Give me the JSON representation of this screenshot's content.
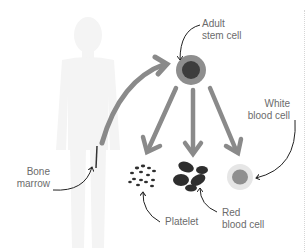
{
  "diagram": {
    "labels": {
      "stem_cell": [
        "Adult",
        "stem cell"
      ],
      "white_blood_cell": [
        "White",
        "blood cell"
      ],
      "bone_marrow": [
        "Bone",
        "marrow"
      ],
      "platelet": "Platelet",
      "red_blood_cell": [
        "Red",
        "blood cell"
      ]
    },
    "nodes": [
      {
        "id": "body",
        "type": "human-silhouette"
      },
      {
        "id": "bone-marrow",
        "type": "location-marker"
      },
      {
        "id": "stem-cell",
        "type": "cell"
      },
      {
        "id": "platelets",
        "type": "cell-cluster"
      },
      {
        "id": "red-blood-cells",
        "type": "cell-cluster"
      },
      {
        "id": "white-blood-cell",
        "type": "cell"
      }
    ],
    "edges": [
      {
        "from": "bone-marrow",
        "to": "stem-cell"
      },
      {
        "from": "stem-cell",
        "to": "platelets"
      },
      {
        "from": "stem-cell",
        "to": "red-blood-cells"
      },
      {
        "from": "stem-cell",
        "to": "white-blood-cell"
      }
    ],
    "colors": {
      "silhouette": "#f4f4f4",
      "arrow": "#8a8a8a",
      "stem_outer": "#8e8e8e",
      "stem_inner": "#3d3d3d",
      "cell_dark": "#2e2e2e",
      "wbc_outer": "#e6e6e6",
      "wbc_inner": "#8f8f8f",
      "label_text": "#6b6b6b",
      "pointer": "#222222"
    }
  }
}
